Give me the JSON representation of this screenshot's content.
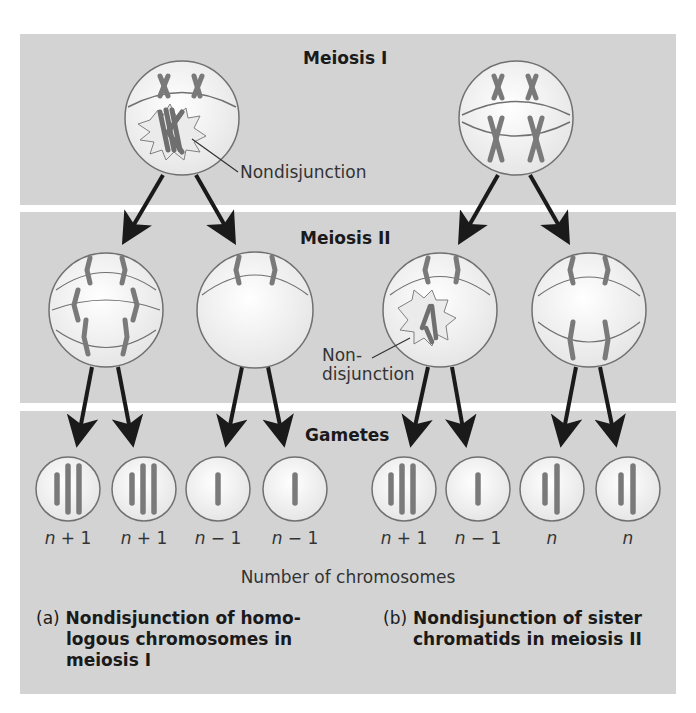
{
  "stages": {
    "meiosis1": "Meiosis I",
    "meiosis2": "Meiosis II",
    "gametes": "Gametes"
  },
  "annotations": {
    "nondisjunction_a": "Nondisjunction",
    "nondisjunction_b_line1": "Non-",
    "nondisjunction_b_line2": "disjunction"
  },
  "gametes": {
    "a": [
      {
        "label_var": "n",
        "label_op": "+ 1",
        "chromosomes": 3
      },
      {
        "label_var": "n",
        "label_op": "+ 1",
        "chromosomes": 3
      },
      {
        "label_var": "n",
        "label_op": "− 1",
        "chromosomes": 1
      },
      {
        "label_var": "n",
        "label_op": "− 1",
        "chromosomes": 1
      }
    ],
    "b": [
      {
        "label_var": "n",
        "label_op": "+ 1",
        "chromosomes": 3
      },
      {
        "label_var": "n",
        "label_op": "− 1",
        "chromosomes": 1
      },
      {
        "label_var": "n",
        "label_op": "",
        "chromosomes": 2
      },
      {
        "label_var": "n",
        "label_op": "",
        "chromosomes": 2
      }
    ]
  },
  "axis_label": "Number of chromosomes",
  "captions": {
    "a": {
      "letter": "(a)",
      "line1": "Nondisjunction of homo-",
      "line2": "logous chromosomes in",
      "line3": "meiosis I"
    },
    "b": {
      "letter": "(b)",
      "line1": "Nondisjunction of sister",
      "line2": "chromatids in meiosis II"
    }
  },
  "colors": {
    "panel": "#d3d3d3",
    "cell_fill": "#f4f4f4",
    "cell_stroke": "#707070",
    "chromosome": "#7a7a7a",
    "arrow": "#1a1a1a"
  }
}
